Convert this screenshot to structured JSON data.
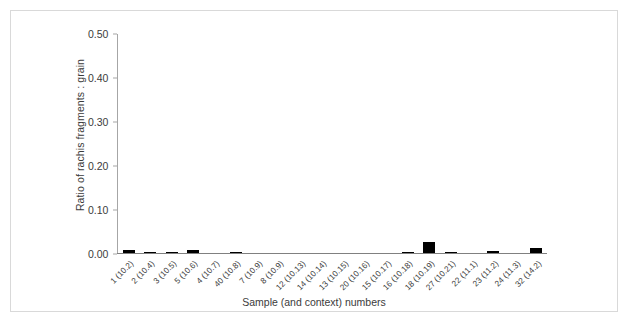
{
  "chart_data": {
    "type": "bar",
    "title": "",
    "xlabel": "Sample (and context) numbers",
    "ylabel": "Ratio of rachis fragments : grain",
    "ylim": [
      0.0,
      0.5
    ],
    "yticks": [
      "0.00",
      "0.10",
      "0.20",
      "0.30",
      "0.40",
      "0.50"
    ],
    "ytick_values": [
      0.0,
      0.1,
      0.2,
      0.3,
      0.4,
      0.5
    ],
    "grid": false,
    "legend": null,
    "bar_color": "#000000",
    "categories": [
      "1 (10.2)",
      "2 (10.4)",
      "3 (10.5)",
      "5 (10.6)",
      "4 (10.7)",
      "40 (10.8)",
      "7 (10.9)",
      "8 (10.9)",
      "12 (10.13)",
      "14 (10.14)",
      "13 (10.15)",
      "20 (10.16)",
      "15 (10.17)",
      "16 (10.18)",
      "18 (10.19)",
      "27 (10.21)",
      "22 (11.1)",
      "23 (11.2)",
      "24 (11.3)",
      "32 (14.2)"
    ],
    "values": [
      0.007,
      0.002,
      0.001,
      0.007,
      0.0,
      0.001,
      0.0,
      0.0,
      0.0,
      0.0,
      0.0,
      0.0,
      0.0,
      0.001,
      0.025,
      0.002,
      0.0,
      0.004,
      0.0,
      0.012
    ]
  }
}
